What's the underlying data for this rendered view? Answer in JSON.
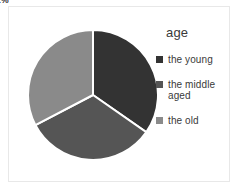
{
  "chart_data": {
    "type": "pie",
    "title": "age",
    "categories": [
      "the young",
      "the middle aged",
      "the old"
    ],
    "values": [
      34,
      32,
      32
    ],
    "value_labels": [
      "34%",
      "32%",
      "32%"
    ],
    "colors": [
      "#333333",
      "#555555",
      "#8a8a8a"
    ],
    "legend_position": "right",
    "grid": false,
    "xlabel": "",
    "ylabel": "",
    "start_angle_deg": 0,
    "direction": "clockwise",
    "slices": [
      {
        "name": "the young",
        "label": "34%",
        "value": 34,
        "color": "#333333",
        "label_visible": false,
        "label_x_pct": 47.5,
        "label_y_pct": 38.0,
        "label_contrast": "on-dark"
      },
      {
        "name": "the middle aged",
        "label": "32%",
        "value": 32,
        "color": "#555555",
        "label_visible": true,
        "label_x_pct": 38.0,
        "label_y_pct": 66.5,
        "label_contrast": "on-medium"
      },
      {
        "name": "the old",
        "label": "32%",
        "value": 32,
        "color": "#8a8a8a",
        "label_visible": true,
        "label_x_pct": 26.5,
        "label_y_pct": 38.0,
        "label_contrast": "on-light"
      }
    ]
  },
  "legend": {
    "title": "age",
    "items": [
      {
        "label": "the young",
        "color": "#333333",
        "swatch_name": "legend-swatch-the-young"
      },
      {
        "label": "the middle aged",
        "color": "#555555",
        "swatch_name": "legend-swatch-the-middle-aged"
      },
      {
        "label": "the old",
        "color": "#8a8a8a",
        "swatch_name": "legend-swatch-the-old"
      }
    ]
  }
}
